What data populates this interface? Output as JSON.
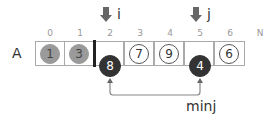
{
  "array": {
    "name": "A",
    "indices": [
      "0",
      "1",
      "2",
      "3",
      "4",
      "5",
      "6",
      "N"
    ],
    "cells": [
      {
        "index": "0",
        "value": "1",
        "state": "sorted"
      },
      {
        "index": "1",
        "value": "3",
        "state": "sorted"
      },
      {
        "index": "2",
        "value": "8",
        "state": "active"
      },
      {
        "index": "3",
        "value": "7",
        "state": "unsorted"
      },
      {
        "index": "4",
        "value": "9",
        "state": "unsorted"
      },
      {
        "index": "5",
        "value": "4",
        "state": "active"
      },
      {
        "index": "6",
        "value": "6",
        "state": "unsorted"
      }
    ]
  },
  "pointers": {
    "i": {
      "label": "i",
      "index": "2"
    },
    "j": {
      "label": "j",
      "index": "5"
    }
  },
  "swap": {
    "label": "minj",
    "from_index": "2",
    "to_index": "5"
  },
  "colors": {
    "sorted": "#9a9a9a",
    "active": "#333333",
    "pointer_arrow": "#666666",
    "connector": "#888888"
  }
}
